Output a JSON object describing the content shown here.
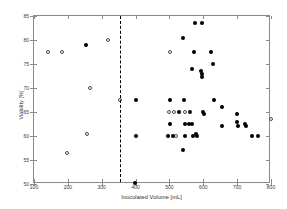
{
  "chart_data": {
    "type": "scatter",
    "title": "",
    "xlabel": "Inoculated Volume [mL]",
    "ylabel": "Viability [%]",
    "xlim": [
      100,
      800
    ],
    "ylim": [
      50,
      85
    ],
    "xticks": [
      100,
      200,
      300,
      400,
      500,
      600,
      700,
      800
    ],
    "yticks": [
      50,
      55,
      60,
      65,
      70,
      75,
      80,
      85
    ],
    "xtick_labels": [
      "100",
      "200",
      "300",
      "400",
      "500",
      "600",
      "700",
      "800"
    ],
    "ytick_labels": [
      "50",
      "55",
      "60",
      "65",
      "70",
      "75",
      "80",
      "85"
    ],
    "grid": false,
    "legend": null,
    "annotations": [
      {
        "name": "threshold-line",
        "type": "vline",
        "x": 355,
        "style": "dashed",
        "color": "#000000"
      }
    ],
    "series": [
      {
        "name": "open-circles",
        "marker": "open-circle",
        "color": "#4a4a4a",
        "points": [
          {
            "x": 140,
            "y": 77.5
          },
          {
            "x": 183,
            "y": 77.5
          },
          {
            "x": 320,
            "y": 80.0
          },
          {
            "x": 265,
            "y": 70.0
          },
          {
            "x": 355,
            "y": 67.5
          },
          {
            "x": 258,
            "y": 60.5
          },
          {
            "x": 196,
            "y": 56.5
          },
          {
            "x": 503,
            "y": 77.5
          },
          {
            "x": 500,
            "y": 65.0
          },
          {
            "x": 513,
            "y": 65.0
          },
          {
            "x": 546,
            "y": 65.0
          },
          {
            "x": 518,
            "y": 60.0
          },
          {
            "x": 800,
            "y": 63.5
          }
        ]
      },
      {
        "name": "filled-circles",
        "marker": "filled-circle",
        "color": "#000000",
        "points": [
          {
            "x": 253,
            "y": 79.0
          },
          {
            "x": 575,
            "y": 83.5
          },
          {
            "x": 597,
            "y": 83.5
          },
          {
            "x": 540,
            "y": 80.5
          },
          {
            "x": 573,
            "y": 77.5
          },
          {
            "x": 622,
            "y": 77.5
          },
          {
            "x": 568,
            "y": 74.0
          },
          {
            "x": 592,
            "y": 73.5
          },
          {
            "x": 596,
            "y": 73.0
          },
          {
            "x": 597,
            "y": 72.3
          },
          {
            "x": 630,
            "y": 75.0
          },
          {
            "x": 401,
            "y": 67.5
          },
          {
            "x": 503,
            "y": 67.5
          },
          {
            "x": 543,
            "y": 67.5
          },
          {
            "x": 655,
            "y": 66.0
          },
          {
            "x": 632,
            "y": 67.5
          },
          {
            "x": 527,
            "y": 65.0
          },
          {
            "x": 560,
            "y": 65.0
          },
          {
            "x": 600,
            "y": 65.0
          },
          {
            "x": 603,
            "y": 64.5
          },
          {
            "x": 700,
            "y": 64.5
          },
          {
            "x": 503,
            "y": 62.5
          },
          {
            "x": 545,
            "y": 62.5
          },
          {
            "x": 557,
            "y": 62.5
          },
          {
            "x": 566,
            "y": 62.5
          },
          {
            "x": 654,
            "y": 62.0
          },
          {
            "x": 700,
            "y": 63.0
          },
          {
            "x": 702,
            "y": 62.0
          },
          {
            "x": 722,
            "y": 62.5
          },
          {
            "x": 726,
            "y": 62.0
          },
          {
            "x": 400,
            "y": 60.0
          },
          {
            "x": 497,
            "y": 60.0
          },
          {
            "x": 510,
            "y": 60.0
          },
          {
            "x": 545,
            "y": 60.0
          },
          {
            "x": 570,
            "y": 60.0
          },
          {
            "x": 578,
            "y": 60.5
          },
          {
            "x": 582,
            "y": 60.0
          },
          {
            "x": 744,
            "y": 60.0
          },
          {
            "x": 763,
            "y": 60.0
          },
          {
            "x": 540,
            "y": 57.0
          },
          {
            "x": 397,
            "y": 50.3
          }
        ]
      }
    ]
  }
}
